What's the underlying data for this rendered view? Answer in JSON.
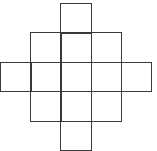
{
  "diagram": {
    "type": "grid-net",
    "line_color": "#3a3a3a",
    "background": "#ffffff",
    "origin": [
      0,
      3
    ],
    "cell_size": [
      30.2,
      29.4
    ],
    "rows": [
      {
        "row": 0,
        "cols": [
          2
        ]
      },
      {
        "row": 1,
        "cols": [
          1,
          2,
          3
        ]
      },
      {
        "row": 2,
        "cols": [
          0,
          1,
          2,
          3,
          4
        ]
      },
      {
        "row": 3,
        "cols": [
          1,
          2,
          3
        ]
      },
      {
        "row": 4,
        "cols": [
          2
        ]
      }
    ],
    "cell_count": 13
  }
}
